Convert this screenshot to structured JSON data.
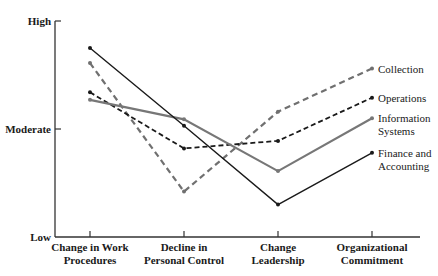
{
  "chart_data": {
    "type": "line",
    "title": "",
    "xlabel": "",
    "ylabel": "",
    "categories": [
      [
        "Change in Work",
        "Procedures"
      ],
      [
        "Decline in",
        "Personal Control"
      ],
      [
        "Change",
        "Leadership"
      ],
      [
        "Organizational",
        "Commitment"
      ]
    ],
    "y_ticks": [
      {
        "label": "High",
        "value": 3
      },
      {
        "label": "Moderate",
        "value": 2
      },
      {
        "label": "Low",
        "value": 1
      }
    ],
    "ylim": [
      1,
      3
    ],
    "grid": false,
    "legend_position": "right, inline labels at line ends",
    "series": [
      {
        "name": "Collection",
        "label_lines": [
          "Collection"
        ],
        "values": [
          2.61,
          1.42,
          2.16,
          2.56
        ],
        "color": "#707070",
        "dash": "6,4",
        "width": 2.2
      },
      {
        "name": "Operations",
        "label_lines": [
          "Operations"
        ],
        "values": [
          2.34,
          1.82,
          1.89,
          2.29
        ],
        "color": "#1a1a1a",
        "dash": "5,3",
        "width": 1.8
      },
      {
        "name": "Information Systems",
        "label_lines": [
          "Information",
          "Systems"
        ],
        "values": [
          2.27,
          2.09,
          1.61,
          2.1
        ],
        "color": "#777777",
        "dash": "",
        "width": 2.2
      },
      {
        "name": "Finance and Accounting",
        "label_lines": [
          "Finance and",
          "Accounting"
        ],
        "values": [
          2.75,
          2.03,
          1.3,
          1.78
        ],
        "color": "#1a1a1a",
        "dash": "",
        "width": 1.4
      }
    ]
  }
}
